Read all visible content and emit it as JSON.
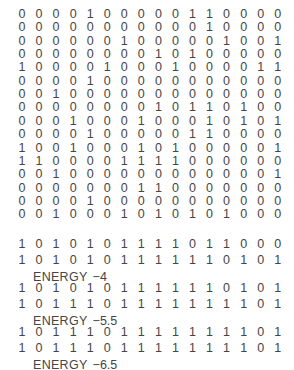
{
  "figure": {
    "kind": "binary-state-matrix",
    "grid_rows": 16,
    "grid_cols": 16,
    "digit_off": "0",
    "digit_on": "1",
    "ink_color": "#454545",
    "background_color": "#ffffff"
  },
  "matrix": {
    "rows": [
      [
        "0",
        "0",
        "0",
        "0",
        "1",
        "0",
        "0",
        "0",
        "0",
        "0",
        "1",
        "1",
        "0",
        "0",
        "0",
        "0"
      ],
      [
        "0",
        "0",
        "0",
        "0",
        "0",
        "0",
        "0",
        "0",
        "0",
        "0",
        "0",
        "1",
        "0",
        "0",
        "0",
        "0"
      ],
      [
        "0",
        "0",
        "0",
        "0",
        "0",
        "0",
        "1",
        "0",
        "0",
        "0",
        "0",
        "0",
        "1",
        "0",
        "0",
        "1"
      ],
      [
        "0",
        "0",
        "0",
        "0",
        "0",
        "0",
        "0",
        "0",
        "1",
        "0",
        "1",
        "0",
        "0",
        "0",
        "0",
        "0"
      ],
      [
        "1",
        "0",
        "0",
        "0",
        "0",
        "1",
        "0",
        "0",
        "0",
        "1",
        "0",
        "0",
        "0",
        "0",
        "1",
        "1"
      ],
      [
        "0",
        "0",
        "0",
        "0",
        "1",
        "0",
        "0",
        "0",
        "0",
        "0",
        "0",
        "0",
        "0",
        "0",
        "0",
        "0"
      ],
      [
        "0",
        "0",
        "1",
        "0",
        "0",
        "0",
        "0",
        "0",
        "0",
        "0",
        "0",
        "0",
        "0",
        "0",
        "0",
        "0"
      ],
      [
        "0",
        "0",
        "0",
        "0",
        "0",
        "0",
        "0",
        "0",
        "1",
        "0",
        "1",
        "1",
        "0",
        "1",
        "0",
        "0"
      ],
      [
        "0",
        "0",
        "0",
        "1",
        "0",
        "0",
        "0",
        "1",
        "0",
        "0",
        "0",
        "1",
        "0",
        "1",
        "0",
        "1"
      ],
      [
        "0",
        "0",
        "0",
        "0",
        "1",
        "0",
        "0",
        "0",
        "0",
        "0",
        "1",
        "1",
        "0",
        "0",
        "0",
        "0"
      ],
      [
        "1",
        "0",
        "0",
        "1",
        "0",
        "0",
        "0",
        "1",
        "0",
        "1",
        "0",
        "0",
        "0",
        "0",
        "0",
        "1"
      ],
      [
        "1",
        "1",
        "0",
        "0",
        "0",
        "0",
        "1",
        "1",
        "1",
        "1",
        "0",
        "0",
        "0",
        "0",
        "0",
        "0"
      ],
      [
        "0",
        "0",
        "1",
        "0",
        "0",
        "0",
        "0",
        "0",
        "0",
        "0",
        "0",
        "0",
        "0",
        "0",
        "0",
        "1"
      ],
      [
        "0",
        "0",
        "0",
        "0",
        "0",
        "0",
        "0",
        "1",
        "1",
        "0",
        "0",
        "0",
        "0",
        "0",
        "0",
        "0"
      ],
      [
        "0",
        "0",
        "0",
        "0",
        "1",
        "0",
        "0",
        "0",
        "0",
        "0",
        "0",
        "0",
        "0",
        "0",
        "0",
        "0"
      ],
      [
        "0",
        "0",
        "1",
        "0",
        "0",
        "0",
        "1",
        "0",
        "1",
        "0",
        "1",
        "0",
        "1",
        "0",
        "0",
        "0"
      ]
    ]
  },
  "sequences": {
    "energy_word": "ENERGY",
    "groups": [
      {
        "label": "energy-group-1",
        "top_row": [
          "1",
          "0",
          "1",
          "0",
          "1",
          "0",
          "1",
          "1",
          "1",
          "1",
          "0",
          "1",
          "1",
          "0",
          "0",
          "0"
        ],
        "bottom_row": [
          "1",
          "0",
          "1",
          "0",
          "1",
          "0",
          "1",
          "1",
          "1",
          "1",
          "1",
          "1",
          "0",
          "1",
          "0",
          "1"
        ],
        "energy_value": "−4"
      },
      {
        "label": "energy-group-2",
        "top_row": [
          "1",
          "0",
          "1",
          "0",
          "1",
          "0",
          "1",
          "1",
          "1",
          "1",
          "1",
          "1",
          "0",
          "1",
          "0",
          "1"
        ],
        "bottom_row": [
          "1",
          "0",
          "1",
          "1",
          "1",
          "0",
          "1",
          "1",
          "1",
          "1",
          "1",
          "1",
          "1",
          "1",
          "0",
          "1"
        ],
        "energy_value": "−5.5"
      },
      {
        "label": "energy-group-3",
        "top_row": [
          "1",
          "0",
          "1",
          "1",
          "1",
          "0",
          "1",
          "1",
          "1",
          "1",
          "1",
          "1",
          "1",
          "1",
          "0",
          "1"
        ],
        "bottom_row": [
          "1",
          "0",
          "1",
          "1",
          "1",
          "0",
          "1",
          "1",
          "1",
          "1",
          "1",
          "1",
          "1",
          "1",
          "0",
          "1"
        ],
        "energy_value": "−6.5"
      }
    ]
  },
  "layout": {
    "matrix_first_row_top": 8,
    "matrix_row_pitch": 13.35,
    "col_first_x": 16,
    "col_pitch": 17.05,
    "sequence_group_pitch": 44,
    "sequence_row_gap": 16,
    "energy_label_offset": 33
  }
}
